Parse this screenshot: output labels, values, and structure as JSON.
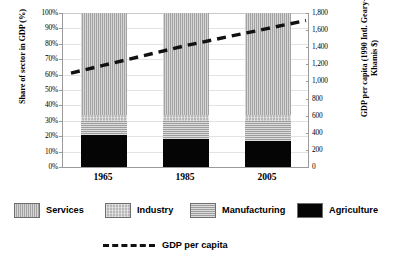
{
  "chart_data": {
    "type": "bar",
    "title": "",
    "subtitle": "",
    "categories": [
      "1965",
      "1985",
      "2005"
    ],
    "stacked": true,
    "grid": true,
    "legend_position": "bottom",
    "xlabel": "",
    "ylabel": "Share of sector in GDP (%)",
    "ylabel_right": "GDP per capita (1990 Intl. Geary-Khamis $)",
    "ylim": [
      0,
      100
    ],
    "ylim_right": [
      0,
      1800
    ],
    "yticks": [
      "0%",
      "10%",
      "20%",
      "30%",
      "40%",
      "50%",
      "60%",
      "70%",
      "80%",
      "90%",
      "100%"
    ],
    "ytick_values": [
      0,
      10,
      20,
      30,
      40,
      50,
      60,
      70,
      80,
      90,
      100
    ],
    "yticks_right": [
      "0",
      "200",
      "400",
      "600",
      "800",
      "1,000",
      "1,200",
      "1,400",
      "1,600",
      "1,800"
    ],
    "ytick_values_right": [
      0,
      200,
      400,
      600,
      800,
      1000,
      1200,
      1400,
      1600,
      1800
    ],
    "series": [
      {
        "name": "Agriculture",
        "pattern": "solid-black",
        "values": [
          21,
          18,
          17
        ]
      },
      {
        "name": "Manufacturing",
        "pattern": "horizontal-lines",
        "values": [
          9,
          12,
          13
        ]
      },
      {
        "name": "Industry",
        "pattern": "fine-dots",
        "values": [
          4,
          4,
          4
        ]
      },
      {
        "name": "Services",
        "pattern": "vertical-lines",
        "values": [
          66,
          66,
          66
        ]
      }
    ],
    "line_series": {
      "name": "GDP per capita",
      "axis": "right",
      "style": "dashed",
      "color": "#111111",
      "values": [
        1190,
        1420,
        1620
      ]
    }
  },
  "legend": {
    "items": [
      {
        "label": "Services"
      },
      {
        "label": "Industry"
      },
      {
        "label": "Manufacturing"
      },
      {
        "label": "Agriculture"
      }
    ],
    "line_item": {
      "label": "GDP per capita"
    }
  }
}
